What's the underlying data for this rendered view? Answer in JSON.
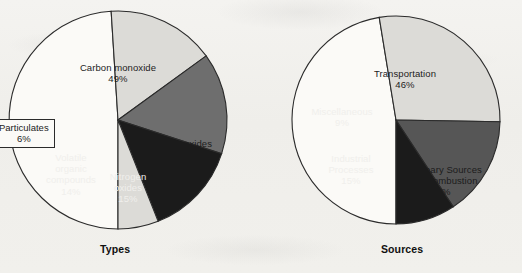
{
  "figure": {
    "background_color": "#f2f1ee",
    "caption_bottom": ""
  },
  "chart_data": [
    {
      "type": "pie",
      "title": "Types",
      "id": "types",
      "center": [
        118,
        120
      ],
      "radius": 109,
      "start_angle_deg": 180,
      "direction": "clockwise",
      "labels": [
        "Carbon monoxide",
        "Sulfur oxides",
        "Nitrogen oxides",
        "Volatile organic compounds",
        "Particulates"
      ],
      "values": [
        49,
        16,
        15,
        14,
        6
      ],
      "unit": "%",
      "colors": [
        "#fbfaf7",
        "#dcdbd7",
        "#6e6e6e",
        "#1b1b1b",
        "#dcdbd7"
      ],
      "slices": [
        {
          "label": "Carbon monoxide",
          "label_lines": [
            "Carbon monoxide"
          ],
          "value": 49,
          "pct_text": "49%",
          "color": "#fbfaf7",
          "text_color": "dark"
        },
        {
          "label": "Sulfur oxides",
          "label_lines": [
            "Sulfur oxides"
          ],
          "value": 16,
          "pct_text": "16%",
          "color": "#dcdbd7",
          "text_color": "dark"
        },
        {
          "label": "Nitrogen oxides",
          "label_lines": [
            "Nitrogen",
            "oxides"
          ],
          "value": 15,
          "pct_text": "15%",
          "color": "#6e6e6e",
          "text_color": "light"
        },
        {
          "label": "Volatile organic compounds",
          "label_lines": [
            "Volatile",
            "organic",
            "compounds"
          ],
          "value": 14,
          "pct_text": "14%",
          "color": "#1b1b1b",
          "text_color": "light"
        },
        {
          "label": "Particulates",
          "label_lines": [
            "Particulates"
          ],
          "value": 6,
          "pct_text": "6%",
          "color": "#dcdbd7",
          "text_color": "dark",
          "callout": true
        }
      ]
    },
    {
      "type": "pie",
      "title": "Sources",
      "id": "sources",
      "center": [
        396,
        120
      ],
      "radius": 104,
      "start_angle_deg": 180,
      "direction": "clockwise",
      "labels": [
        "Transportation",
        "Stationary Sources Fuel Combustion",
        "Industrial Processes",
        "Miscellaneous"
      ],
      "values": [
        46,
        27,
        15,
        9
      ],
      "unit": "%",
      "colors": [
        "#fbfaf7",
        "#dcdbd7",
        "#565656",
        "#1b1b1b"
      ],
      "slices": [
        {
          "label": "Transportation",
          "label_lines": [
            "Transportation"
          ],
          "value": 46,
          "pct_text": "46%",
          "color": "#fbfaf7",
          "text_color": "dark"
        },
        {
          "label": "Stationary Sources Fuel Combustion",
          "label_lines": [
            "Stationary Sources",
            "Fuel Combustion"
          ],
          "value": 27,
          "pct_text": "27%",
          "color": "#dcdbd7",
          "text_color": "dark"
        },
        {
          "label": "Industrial Processes",
          "label_lines": [
            "Industrial",
            "Processes"
          ],
          "value": 15,
          "pct_text": "15%",
          "color": "#565656",
          "text_color": "light"
        },
        {
          "label": "Miscellaneous",
          "label_lines": [
            "Miscellaneous"
          ],
          "value": 9,
          "pct_text": "9%",
          "color": "#1b1b1b",
          "text_color": "light"
        }
      ]
    }
  ],
  "captions": {
    "left": "Types",
    "right": "Sources"
  },
  "labels": {
    "types": {
      "carbon_monoxide": {
        "name": "Carbon monoxide",
        "pct": "49%"
      },
      "sulfur_oxides": {
        "name": "Sulfur oxides",
        "pct": "16%"
      },
      "nitrogen_oxides": {
        "line1": "Nitrogen",
        "line2": "oxides",
        "pct": "15%"
      },
      "voc": {
        "line1": "Volatile",
        "line2": "organic",
        "line3": "compounds",
        "pct": "14%"
      },
      "particulates": {
        "name": "Particulates",
        "pct": "6%"
      }
    },
    "sources": {
      "transportation": {
        "name": "Transportation",
        "pct": "46%"
      },
      "stationary": {
        "line1": "Stationary Sources",
        "line2": "Fuel Combustion",
        "pct": "27%"
      },
      "industrial": {
        "line1": "Industrial",
        "line2": "Processes",
        "pct": "15%"
      },
      "miscellaneous": {
        "name": "Miscellaneous",
        "pct": "9%"
      }
    }
  }
}
